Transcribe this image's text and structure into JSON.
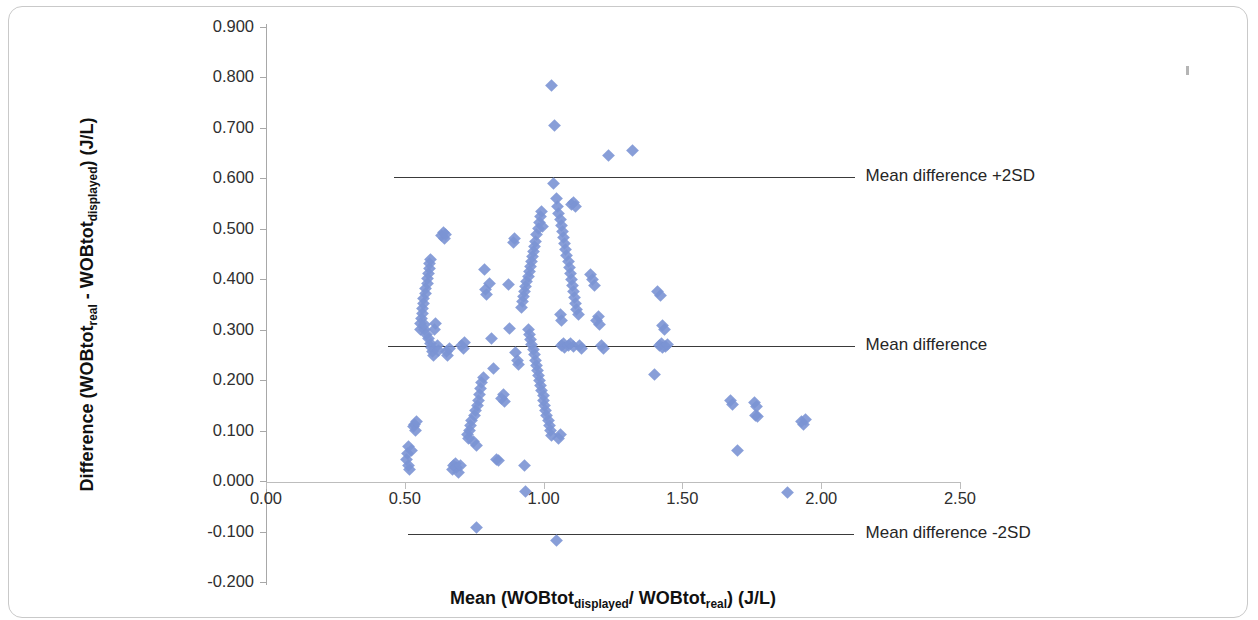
{
  "chart_data": {
    "type": "scatter",
    "title": "",
    "xlabel": "Mean (WOBtot_displayed / WOBtot_real) (J/L)",
    "ylabel": "Difference (WOBtot_real - WOBtot_displayed) (J/L)",
    "xlabel_parts": {
      "pre": "Mean (WOBtot",
      "sub1": "displayed",
      "mid": "/ WOBtot",
      "sub2": "real",
      "post": ") (J/L)"
    },
    "ylabel_parts": {
      "pre": "Difference (WOBtot",
      "sub1": "real",
      "mid": " - WOBtot",
      "sub2": "displayed",
      "post": ") (J/L)"
    },
    "xlim": [
      0.0,
      2.5
    ],
    "ylim": [
      -0.2,
      0.9
    ],
    "xticks": [
      "0.00",
      "0.50",
      "1.00",
      "1.50",
      "2.00",
      "2.50"
    ],
    "xtick_values": [
      0.0,
      0.5,
      1.0,
      1.5,
      2.0,
      2.5
    ],
    "yticks": [
      "0.900",
      "0.800",
      "0.700",
      "0.600",
      "0.500",
      "0.400",
      "0.300",
      "0.200",
      "0.100",
      "0.000",
      "-0.100",
      "-0.200"
    ],
    "ytick_values": [
      0.9,
      0.8,
      0.7,
      0.6,
      0.5,
      0.4,
      0.3,
      0.2,
      0.1,
      0.0,
      -0.1,
      -0.2
    ],
    "grid": false,
    "legend": "none",
    "marker_color": "#7b94d4",
    "marker_shape": "diamond",
    "reference_lines": [
      {
        "name": "upper-loa",
        "label": "Mean difference +2SD",
        "y": 0.602,
        "x_start": 0.46,
        "x_end": 2.12,
        "label_x": 2.16
      },
      {
        "name": "mean-line",
        "label": "Mean difference",
        "y": 0.268,
        "x_start": 0.44,
        "x_end": 2.12,
        "label_x": 2.16
      },
      {
        "name": "lower-loa",
        "label": "Mean difference -2SD",
        "y": -0.105,
        "x_start": 0.51,
        "x_end": 2.12,
        "label_x": 2.16
      }
    ],
    "points": [
      [
        0.505,
        0.043
      ],
      [
        0.508,
        0.055
      ],
      [
        0.512,
        0.03
      ],
      [
        0.515,
        0.068
      ],
      [
        0.518,
        0.022
      ],
      [
        0.524,
        0.06
      ],
      [
        0.53,
        0.108
      ],
      [
        0.534,
        0.113
      ],
      [
        0.537,
        0.1
      ],
      [
        0.542,
        0.118
      ],
      [
        0.556,
        0.3
      ],
      [
        0.558,
        0.312
      ],
      [
        0.56,
        0.322
      ],
      [
        0.562,
        0.332
      ],
      [
        0.564,
        0.342
      ],
      [
        0.566,
        0.352
      ],
      [
        0.568,
        0.362
      ],
      [
        0.57,
        0.3
      ],
      [
        0.572,
        0.31
      ],
      [
        0.574,
        0.372
      ],
      [
        0.576,
        0.382
      ],
      [
        0.578,
        0.29
      ],
      [
        0.58,
        0.392
      ],
      [
        0.582,
        0.402
      ],
      [
        0.584,
        0.282
      ],
      [
        0.586,
        0.412
      ],
      [
        0.588,
        0.422
      ],
      [
        0.59,
        0.432
      ],
      [
        0.592,
        0.272
      ],
      [
        0.594,
        0.44
      ],
      [
        0.596,
        0.265
      ],
      [
        0.6,
        0.256
      ],
      [
        0.604,
        0.248
      ],
      [
        0.608,
        0.3
      ],
      [
        0.612,
        0.312
      ],
      [
        0.616,
        0.268
      ],
      [
        0.62,
        0.258
      ],
      [
        0.634,
        0.487
      ],
      [
        0.638,
        0.493
      ],
      [
        0.642,
        0.48
      ],
      [
        0.646,
        0.488
      ],
      [
        0.65,
        0.256
      ],
      [
        0.655,
        0.248
      ],
      [
        0.66,
        0.262
      ],
      [
        0.672,
        0.022
      ],
      [
        0.676,
        0.03
      ],
      [
        0.682,
        0.035
      ],
      [
        0.688,
        0.026
      ],
      [
        0.694,
        0.018
      ],
      [
        0.7,
        0.03
      ],
      [
        0.706,
        0.268
      ],
      [
        0.71,
        0.262
      ],
      [
        0.714,
        0.274
      ],
      [
        0.726,
        0.093
      ],
      [
        0.73,
        0.084
      ],
      [
        0.734,
        0.1
      ],
      [
        0.738,
        0.11
      ],
      [
        0.742,
        0.12
      ],
      [
        0.746,
        0.078
      ],
      [
        0.75,
        0.13
      ],
      [
        0.754,
        0.14
      ],
      [
        0.758,
        0.07
      ],
      [
        0.762,
        0.15
      ],
      [
        0.766,
        0.16
      ],
      [
        0.77,
        0.172
      ],
      [
        0.774,
        0.183
      ],
      [
        0.778,
        0.195
      ],
      [
        0.782,
        0.206
      ],
      [
        0.788,
        0.42
      ],
      [
        0.792,
        0.38
      ],
      [
        0.796,
        0.37
      ],
      [
        0.806,
        0.392
      ],
      [
        0.812,
        0.282
      ],
      [
        0.818,
        0.223
      ],
      [
        0.83,
        0.042
      ],
      [
        0.836,
        0.04
      ],
      [
        0.848,
        0.164
      ],
      [
        0.854,
        0.172
      ],
      [
        0.86,
        0.158
      ],
      [
        0.872,
        0.39
      ],
      [
        0.878,
        0.302
      ],
      [
        0.89,
        0.473
      ],
      [
        0.896,
        0.48
      ],
      [
        0.9,
        0.254
      ],
      [
        0.905,
        0.24
      ],
      [
        0.91,
        0.232
      ],
      [
        0.92,
        0.345
      ],
      [
        0.924,
        0.355
      ],
      [
        0.928,
        0.365
      ],
      [
        0.932,
        0.375
      ],
      [
        0.936,
        0.385
      ],
      [
        0.94,
        0.395
      ],
      [
        0.944,
        0.405
      ],
      [
        0.948,
        0.415
      ],
      [
        0.952,
        0.425
      ],
      [
        0.956,
        0.435
      ],
      [
        0.96,
        0.445
      ],
      [
        0.964,
        0.455
      ],
      [
        0.968,
        0.465
      ],
      [
        0.972,
        0.475
      ],
      [
        0.976,
        0.488
      ],
      [
        0.98,
        0.5
      ],
      [
        0.984,
        0.512
      ],
      [
        0.988,
        0.524
      ],
      [
        0.992,
        0.534
      ],
      [
        0.996,
        0.505
      ],
      [
        0.946,
        0.3
      ],
      [
        0.95,
        0.29
      ],
      [
        0.954,
        0.28
      ],
      [
        0.958,
        0.27
      ],
      [
        0.962,
        0.26
      ],
      [
        0.966,
        0.25
      ],
      [
        0.97,
        0.24
      ],
      [
        0.974,
        0.23
      ],
      [
        0.978,
        0.22
      ],
      [
        0.982,
        0.21
      ],
      [
        0.986,
        0.2
      ],
      [
        0.99,
        0.19
      ],
      [
        0.994,
        0.18
      ],
      [
        0.998,
        0.17
      ],
      [
        0.93,
        0.03
      ],
      [
        0.935,
        -0.02
      ],
      [
        1.0,
        0.16
      ],
      [
        1.004,
        0.15
      ],
      [
        1.008,
        0.14
      ],
      [
        1.012,
        0.13
      ],
      [
        1.016,
        0.12
      ],
      [
        1.02,
        0.11
      ],
      [
        1.024,
        0.1
      ],
      [
        1.028,
        0.09
      ],
      [
        1.03,
        0.785
      ],
      [
        1.04,
        0.705
      ],
      [
        1.035,
        0.59
      ],
      [
        1.045,
        0.56
      ],
      [
        1.05,
        0.545
      ],
      [
        1.055,
        0.53
      ],
      [
        1.06,
        0.518
      ],
      [
        1.064,
        0.506
      ],
      [
        1.068,
        0.494
      ],
      [
        1.072,
        0.482
      ],
      [
        1.076,
        0.47
      ],
      [
        1.08,
        0.46
      ],
      [
        1.084,
        0.448
      ],
      [
        1.088,
        0.436
      ],
      [
        1.092,
        0.424
      ],
      [
        1.096,
        0.412
      ],
      [
        1.1,
        0.4
      ],
      [
        1.104,
        0.388
      ],
      [
        1.108,
        0.376
      ],
      [
        1.112,
        0.364
      ],
      [
        1.116,
        0.352
      ],
      [
        1.12,
        0.34
      ],
      [
        1.124,
        0.33
      ],
      [
        1.1,
        0.548
      ],
      [
        1.108,
        0.552
      ],
      [
        1.116,
        0.545
      ],
      [
        1.06,
        0.33
      ],
      [
        1.066,
        0.318
      ],
      [
        1.064,
        0.268
      ],
      [
        1.07,
        0.272
      ],
      [
        1.076,
        0.264
      ],
      [
        1.09,
        0.268
      ],
      [
        1.098,
        0.272
      ],
      [
        1.106,
        0.266
      ],
      [
        1.13,
        0.268
      ],
      [
        1.136,
        0.262
      ],
      [
        1.055,
        0.085
      ],
      [
        1.06,
        0.092
      ],
      [
        1.045,
        -0.118
      ],
      [
        1.168,
        0.41
      ],
      [
        1.176,
        0.4
      ],
      [
        1.182,
        0.388
      ],
      [
        1.19,
        0.318
      ],
      [
        1.196,
        0.326
      ],
      [
        1.202,
        0.31
      ],
      [
        1.21,
        0.268
      ],
      [
        1.216,
        0.262
      ],
      [
        1.232,
        0.645
      ],
      [
        1.32,
        0.655
      ],
      [
        1.412,
        0.375
      ],
      [
        1.42,
        0.368
      ],
      [
        1.43,
        0.308
      ],
      [
        1.436,
        0.3
      ],
      [
        1.418,
        0.268
      ],
      [
        1.424,
        0.272
      ],
      [
        1.43,
        0.264
      ],
      [
        1.438,
        0.266
      ],
      [
        1.446,
        0.27
      ],
      [
        1.4,
        0.212
      ],
      [
        1.672,
        0.16
      ],
      [
        1.68,
        0.152
      ],
      [
        1.7,
        0.06
      ],
      [
        1.76,
        0.155
      ],
      [
        1.768,
        0.148
      ],
      [
        1.764,
        0.13
      ],
      [
        1.772,
        0.128
      ],
      [
        1.93,
        0.118
      ],
      [
        1.938,
        0.112
      ],
      [
        1.944,
        0.122
      ],
      [
        1.88,
        -0.022
      ],
      [
        0.76,
        -0.092
      ]
    ]
  }
}
